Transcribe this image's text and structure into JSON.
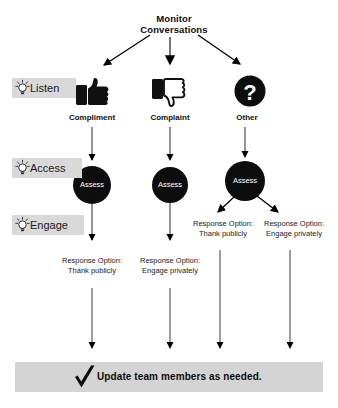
{
  "diagram": {
    "title": "Monitor\nConversations",
    "title_line1": "Monitor",
    "title_line2": "Conversations",
    "background_color": "#ffffff",
    "accent_color": "#000000",
    "chip_color": "#d9d9d9",
    "bar_color": "#d4d4d4"
  },
  "stages": [
    {
      "label": "Listen",
      "icon": "lightbulb-icon"
    },
    {
      "label": "Access",
      "icon": "lightbulb-icon"
    },
    {
      "label": "Engage",
      "icon": "lightbulb-icon"
    }
  ],
  "categories": [
    {
      "caption": "Compliment",
      "icon": "thumbs-up-icon"
    },
    {
      "caption": "Complaint",
      "icon": "thumbs-down-icon"
    },
    {
      "caption": "Other",
      "icon": "question-mark-icon"
    }
  ],
  "assess_nodes": [
    {
      "label": "Assess"
    },
    {
      "label": "Assess"
    },
    {
      "label": "Assess"
    }
  ],
  "responses": [
    {
      "line1": "Response Option:",
      "line2": "Thank publicly",
      "from": "Compliment"
    },
    {
      "line1": "Response Option:",
      "line2": "Engage privately",
      "from": "Complaint"
    },
    {
      "line1": "Response Option:",
      "line2": "Thank publicly",
      "from": "Other"
    },
    {
      "line1": "Response Option:",
      "line2": "Engage privately",
      "from": "Other"
    }
  ],
  "footer": {
    "text": "Update team members as needed.",
    "icon": "checkmark-icon"
  }
}
